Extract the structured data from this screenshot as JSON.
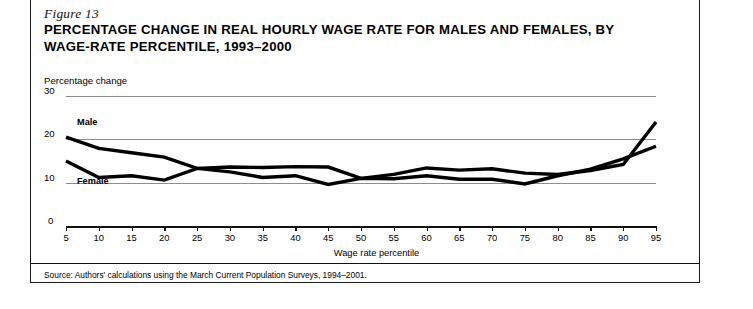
{
  "figure": {
    "label": "Figure 13",
    "title": "PERCENTAGE CHANGE IN REAL HOURLY WAGE RATE FOR MALES AND FEMALES, BY WAGE-RATE PERCENTILE, 1993–2000",
    "source": "Source: Authors' calculations using the March Current Population Surveys, 1994–2001."
  },
  "chart_data": {
    "type": "line",
    "title": "Percentage Change in Real Hourly Wage Rate for Males and Females, by Wage-Rate Percentile, 1993–2000",
    "xlabel": "Wage rate percentile",
    "ylabel": "Percentage change",
    "x": [
      5,
      10,
      15,
      20,
      25,
      30,
      35,
      40,
      45,
      50,
      55,
      60,
      65,
      70,
      75,
      80,
      85,
      90,
      95
    ],
    "xlim": [
      5,
      95
    ],
    "ylim": [
      0,
      30
    ],
    "yticks": [
      0,
      10,
      20,
      30
    ],
    "xticks": [
      5,
      10,
      15,
      20,
      25,
      30,
      35,
      40,
      45,
      50,
      55,
      60,
      65,
      70,
      75,
      80,
      85,
      90,
      95
    ],
    "grid": true,
    "legend": "inline-labels",
    "series": [
      {
        "name": "Male",
        "color": "#000000",
        "values": [
          20.5,
          17.9,
          16.9,
          15.9,
          13.3,
          13.6,
          13.5,
          13.7,
          13.6,
          11.0,
          11.9,
          13.4,
          12.9,
          13.2,
          12.2,
          11.9,
          12.8,
          14.2,
          24.0
        ]
      },
      {
        "name": "Female",
        "color": "#000000",
        "values": [
          15.0,
          11.2,
          11.6,
          10.6,
          13.3,
          12.5,
          11.2,
          11.6,
          9.6,
          11.0,
          10.9,
          11.6,
          10.8,
          10.8,
          9.7,
          11.6,
          13.1,
          15.5,
          18.4
        ]
      }
    ]
  },
  "labels": {
    "y_axis_caption": "Percentage change",
    "male": "Male",
    "female": "Female"
  }
}
